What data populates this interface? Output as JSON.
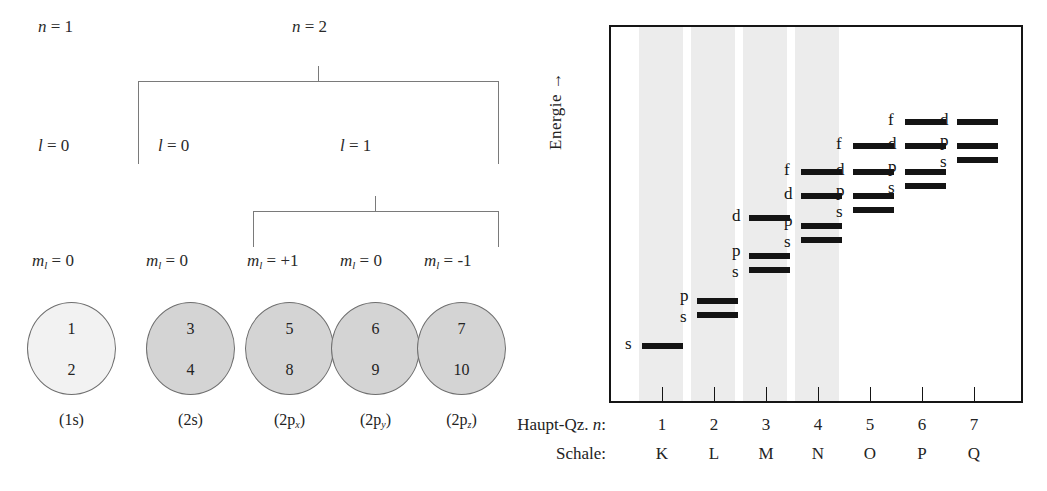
{
  "figure": {
    "left_diagram": {
      "n_labels": [
        {
          "text": "n = 1",
          "x": 38,
          "y": 18
        },
        {
          "text": "n = 2",
          "x": 292,
          "y": 18
        }
      ],
      "l_labels": [
        {
          "text": "l = 0",
          "x": 38,
          "y": 137
        },
        {
          "text": "l = 0",
          "x": 158,
          "y": 137
        },
        {
          "text": "l = 1",
          "x": 340,
          "y": 137
        }
      ],
      "ml_labels": [
        {
          "text": "m",
          "sub": "l",
          "rest": " = 0",
          "x": 32,
          "y": 252
        },
        {
          "text": "m",
          "sub": "l",
          "rest": " = 0",
          "x": 146,
          "y": 252
        },
        {
          "text": "m",
          "sub": "l",
          "rest": " = +1",
          "x": 247,
          "y": 252
        },
        {
          "text": "m",
          "sub": "l",
          "rest": " = 0",
          "x": 340,
          "y": 252
        },
        {
          "text": "m",
          "sub": "l",
          "rest": " = -1",
          "x": 424,
          "y": 252
        }
      ],
      "orbitals": [
        {
          "caption": "(1s)",
          "sub": "",
          "top": "1",
          "bottom": "2",
          "filled": false
        },
        {
          "caption": "(2s)",
          "sub": "",
          "top": "3",
          "bottom": "4",
          "filled": true
        },
        {
          "caption": "(2p",
          "sub": "x",
          "top": "5",
          "bottom": "8",
          "filled": true
        },
        {
          "caption": "(2p",
          "sub": "y",
          "top": "6",
          "bottom": "9",
          "filled": true
        },
        {
          "caption": "(2p",
          "sub": "z",
          "top": "7",
          "bottom": "10",
          "filled": true
        }
      ]
    },
    "right_diagram": {
      "y_axis_label": "Energie  →",
      "row_label_n": "Haupt-Qz. n:",
      "row_label_shell": "Schale:",
      "n_values": [
        "1",
        "2",
        "3",
        "4",
        "5",
        "6",
        "7"
      ],
      "shell_values": [
        "K",
        "L",
        "M",
        "N",
        "O",
        "P",
        "Q"
      ],
      "shaded_band_color": "#ececec",
      "level_color": "#141414",
      "levels": [
        {
          "shell": 1,
          "orbital": "s",
          "x": 31,
          "w": 41,
          "y": 316,
          "label_x": 14,
          "label_y": 308
        },
        {
          "shell": 2,
          "orbital": "p",
          "x": 86,
          "w": 41,
          "y": 271,
          "label_x": 69,
          "label_y": 260
        },
        {
          "shell": 2,
          "orbital": "s",
          "x": 86,
          "w": 41,
          "y": 285,
          "label_x": 69,
          "label_y": 281
        },
        {
          "shell": 3,
          "orbital": "d",
          "x": 138,
          "w": 41,
          "y": 188,
          "label_x": 121,
          "label_y": 180
        },
        {
          "shell": 3,
          "orbital": "p",
          "x": 138,
          "w": 41,
          "y": 226,
          "label_x": 121,
          "label_y": 215
        },
        {
          "shell": 3,
          "orbital": "s",
          "x": 138,
          "w": 41,
          "y": 240,
          "label_x": 121,
          "label_y": 236
        },
        {
          "shell": 4,
          "orbital": "f",
          "x": 190,
          "w": 41,
          "y": 142,
          "label_x": 173,
          "label_y": 134
        },
        {
          "shell": 4,
          "orbital": "d",
          "x": 190,
          "w": 41,
          "y": 166,
          "label_x": 173,
          "label_y": 158
        },
        {
          "shell": 4,
          "orbital": "p",
          "x": 190,
          "w": 41,
          "y": 196,
          "label_x": 173,
          "label_y": 185
        },
        {
          "shell": 4,
          "orbital": "s",
          "x": 190,
          "w": 41,
          "y": 210,
          "label_x": 173,
          "label_y": 206
        },
        {
          "shell": 5,
          "orbital": "f",
          "x": 242,
          "w": 41,
          "y": 116,
          "label_x": 225,
          "label_y": 108
        },
        {
          "shell": 5,
          "orbital": "d",
          "x": 242,
          "w": 41,
          "y": 142,
          "label_x": 225,
          "label_y": 134
        },
        {
          "shell": 5,
          "orbital": "p",
          "x": 242,
          "w": 41,
          "y": 166,
          "label_x": 225,
          "label_y": 155
        },
        {
          "shell": 5,
          "orbital": "s",
          "x": 242,
          "w": 41,
          "y": 180,
          "label_x": 225,
          "label_y": 176
        },
        {
          "shell": 6,
          "orbital": "f",
          "x": 294,
          "w": 41,
          "y": 92,
          "label_x": 277,
          "label_y": 84
        },
        {
          "shell": 6,
          "orbital": "d",
          "x": 294,
          "w": 41,
          "y": 116,
          "label_x": 277,
          "label_y": 108
        },
        {
          "shell": 6,
          "orbital": "p",
          "x": 294,
          "w": 41,
          "y": 142,
          "label_x": 277,
          "label_y": 131
        },
        {
          "shell": 6,
          "orbital": "s",
          "x": 294,
          "w": 41,
          "y": 156,
          "label_x": 277,
          "label_y": 152
        },
        {
          "shell": 7,
          "orbital": "d",
          "x": 346,
          "w": 41,
          "y": 92,
          "label_x": 329,
          "label_y": 84
        },
        {
          "shell": 7,
          "orbital": "p",
          "x": 346,
          "w": 41,
          "y": 116,
          "label_x": 329,
          "label_y": 105
        },
        {
          "shell": 7,
          "orbital": "s",
          "x": 346,
          "w": 41,
          "y": 130,
          "label_x": 329,
          "label_y": 126
        }
      ],
      "tick_x": [
        51,
        103,
        155,
        207,
        259,
        311,
        363
      ],
      "bands": [
        {
          "x": 28,
          "w": 44
        },
        {
          "x": 80,
          "w": 44
        },
        {
          "x": 132,
          "w": 44
        },
        {
          "x": 184,
          "w": 44
        }
      ]
    }
  }
}
